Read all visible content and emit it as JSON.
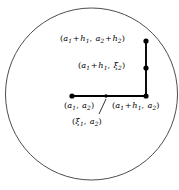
{
  "figure": {
    "background_color": "#ffffff",
    "stroke_color": "#000000",
    "circle_stroke_color": "#4d4d4d"
  },
  "labels": {
    "top_corner": {
      "name": "point-a-plus-h",
      "parts": [
        "(",
        "a",
        "1",
        " + ",
        "h",
        "1",
        ", ",
        "a",
        "2",
        " + ",
        "h",
        "2",
        ")"
      ],
      "plain": "(a1 + h1, a2 + h2)"
    },
    "mid_xi2": {
      "name": "point-xi2",
      "plain": "(a1 + h1, ξ2)"
    },
    "origin": {
      "name": "point-a",
      "plain": "(a1, a2)"
    },
    "right_base": {
      "name": "point-a1-plus-h1-a2",
      "plain": "(a1 + h1, a2)"
    },
    "xi1": {
      "name": "point-xi1",
      "plain": "(ξ1, a2)"
    }
  },
  "glyphs": {
    "lparen": "(",
    "rparen": ")",
    "comma": ",",
    "plus": "+",
    "a": "a",
    "h": "h",
    "xi": "ξ",
    "one": "1",
    "two": "2"
  },
  "chart_data": {
    "type": "scatter",
    "xlabel": "",
    "ylabel": "",
    "xlim": [
      0,
      179
    ],
    "ylim": [
      0,
      190
    ],
    "grid": false,
    "legend": "none",
    "circle": {
      "center_x": 91.5,
      "center_y": 94,
      "radius": 86,
      "stroke_width": 1.0,
      "fill": "none"
    },
    "path_segments": [
      {
        "name": "horizontal-segment",
        "x1": 72,
        "y1": 96,
        "x2": 146,
        "y2": 96,
        "stroke_width": 1.9
      },
      {
        "name": "vertical-segment",
        "x1": 146,
        "y1": 96,
        "x2": 146,
        "y2": 41,
        "stroke_width": 1.9
      }
    ],
    "leader_line": {
      "name": "xi1-leader",
      "x1": 106,
      "y1": 99,
      "x2": 99,
      "y2": 114,
      "stroke_width": 0.8
    },
    "points": [
      {
        "name": "a",
        "x": 72,
        "y": 96,
        "r": 2.6,
        "label": "(a1, a2)"
      },
      {
        "name": "xi1",
        "x": 106,
        "y": 96,
        "r": 1.7,
        "label": "(ξ1, a2)"
      },
      {
        "name": "a1h1a2",
        "x": 146,
        "y": 96,
        "r": 2.6,
        "label": "(a1 + h1, a2)"
      },
      {
        "name": "xi2",
        "x": 146,
        "y": 68,
        "r": 2.6,
        "label": "(a1 + h1, ξ2)"
      },
      {
        "name": "ah",
        "x": 146,
        "y": 41,
        "r": 2.6,
        "label": "(a1 + h1, a2 + h2)"
      }
    ]
  }
}
